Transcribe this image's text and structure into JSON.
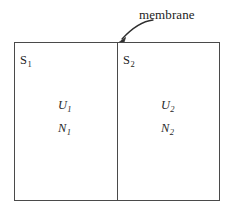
{
  "figure": {
    "type": "diagram",
    "background_color": "#ffffff",
    "line_color": "#4a4a4a",
    "text_color": "#232323"
  },
  "annotation": {
    "label": "membrane",
    "arrow_icon": "curved-arrow-icon",
    "points_to": "divider"
  },
  "vessel": {
    "name": "container-box",
    "divider_name": "membrane-divider"
  },
  "chambers": [
    {
      "id": "left",
      "tag_symbol": "S",
      "tag_subscript": "1",
      "variables": [
        {
          "symbol": "U",
          "subscript": "1"
        },
        {
          "symbol": "N",
          "subscript": "1"
        }
      ]
    },
    {
      "id": "right",
      "tag_symbol": "S",
      "tag_subscript": "2",
      "variables": [
        {
          "symbol": "U",
          "subscript": "2"
        },
        {
          "symbol": "N",
          "subscript": "2"
        }
      ]
    }
  ]
}
